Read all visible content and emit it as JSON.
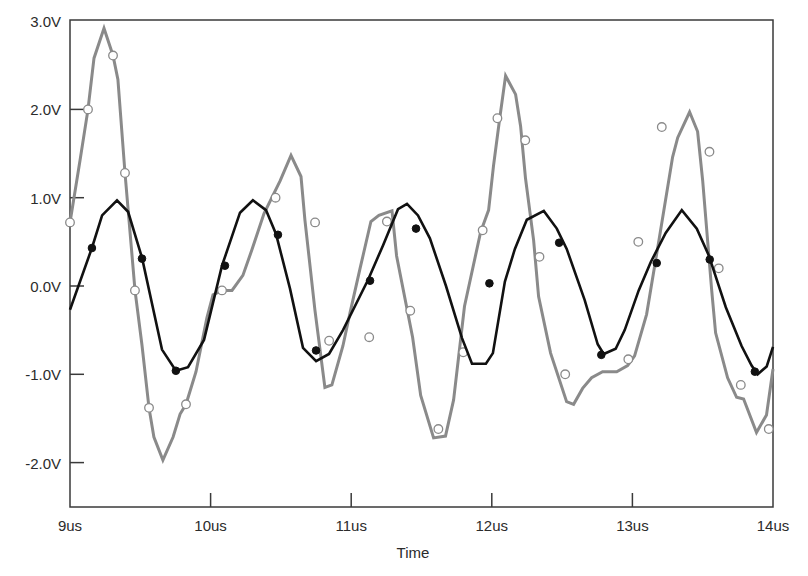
{
  "chart_data": {
    "type": "line",
    "title": "",
    "xlabel": "Time",
    "ylabel": "",
    "xlim": [
      9,
      14
    ],
    "ylim": [
      -2.5,
      3.0
    ],
    "x_ticks": [
      9,
      10,
      11,
      12,
      13,
      14
    ],
    "x_tick_labels": [
      "9us",
      "10us",
      "11us",
      "12us",
      "13us",
      "14us"
    ],
    "y_ticks": [
      3.0,
      2.0,
      1.0,
      0.0,
      -1.0,
      -2.0
    ],
    "y_tick_labels": [
      "3.0V",
      "2.0V",
      "1.0V",
      "0.0V",
      "-1.0V",
      "-2.0V"
    ],
    "grid": false,
    "legend": "none",
    "series": [
      {
        "name": "signal-gray",
        "color": "#8a8a8a",
        "marker": "open-circle",
        "points": [
          [
            9.0,
            0.72
          ],
          [
            9.071,
            1.42
          ],
          [
            9.128,
            2.0
          ],
          [
            9.171,
            2.58
          ],
          [
            9.242,
            2.92
          ],
          [
            9.306,
            2.61
          ],
          [
            9.341,
            2.34
          ],
          [
            9.391,
            1.28
          ],
          [
            9.462,
            -0.05
          ],
          [
            9.512,
            -0.67
          ],
          [
            9.562,
            -1.38
          ],
          [
            9.597,
            -1.71
          ],
          [
            9.661,
            -1.97
          ],
          [
            9.733,
            -1.71
          ],
          [
            9.783,
            -1.45
          ],
          [
            9.825,
            -1.34
          ],
          [
            9.896,
            -0.97
          ],
          [
            9.974,
            -0.36
          ],
          [
            10.017,
            -0.1
          ],
          [
            10.081,
            -0.05
          ],
          [
            10.152,
            -0.05
          ],
          [
            10.23,
            0.12
          ],
          [
            10.294,
            0.41
          ],
          [
            10.38,
            0.82
          ],
          [
            10.494,
            1.19
          ],
          [
            10.572,
            1.48
          ],
          [
            10.643,
            1.24
          ],
          [
            10.671,
            0.75
          ],
          [
            10.742,
            -0.27
          ],
          [
            10.813,
            -1.15
          ],
          [
            10.863,
            -1.12
          ],
          [
            10.941,
            -0.68
          ],
          [
            10.991,
            -0.31
          ],
          [
            11.062,
            0.19
          ],
          [
            11.14,
            0.73
          ],
          [
            11.197,
            0.8
          ],
          [
            11.29,
            0.85
          ],
          [
            11.323,
            0.34
          ],
          [
            11.437,
            -0.58
          ],
          [
            11.494,
            -1.24
          ],
          [
            11.586,
            -1.72
          ],
          [
            11.671,
            -1.7
          ],
          [
            11.728,
            -1.29
          ],
          [
            11.806,
            -0.23
          ],
          [
            11.92,
            0.61
          ],
          [
            11.977,
            0.86
          ],
          [
            12.012,
            1.36
          ],
          [
            12.055,
            1.88
          ],
          [
            12.098,
            2.38
          ],
          [
            12.169,
            2.17
          ],
          [
            12.205,
            1.81
          ],
          [
            12.24,
            1.22
          ],
          [
            12.297,
            0.52
          ],
          [
            12.333,
            -0.12
          ],
          [
            12.418,
            -0.76
          ],
          [
            12.532,
            -1.31
          ],
          [
            12.582,
            -1.34
          ],
          [
            12.646,
            -1.16
          ],
          [
            12.71,
            -1.04
          ],
          [
            12.788,
            -0.97
          ],
          [
            12.888,
            -0.97
          ],
          [
            12.966,
            -0.9
          ],
          [
            13.016,
            -0.79
          ],
          [
            13.101,
            -0.32
          ],
          [
            13.194,
            0.57
          ],
          [
            13.286,
            1.46
          ],
          [
            13.322,
            1.68
          ],
          [
            13.407,
            1.97
          ],
          [
            13.464,
            1.75
          ],
          [
            13.5,
            1.19
          ],
          [
            13.564,
            -0.05
          ],
          [
            13.592,
            -0.53
          ],
          [
            13.677,
            -1.04
          ],
          [
            13.741,
            -1.26
          ],
          [
            13.791,
            -1.28
          ],
          [
            13.883,
            -1.66
          ],
          [
            13.954,
            -1.46
          ],
          [
            14.0,
            -0.94
          ]
        ],
        "markers": [
          [
            9.0,
            0.72
          ],
          [
            9.128,
            2.0
          ],
          [
            9.306,
            2.61
          ],
          [
            9.391,
            1.28
          ],
          [
            9.462,
            -0.05
          ],
          [
            9.562,
            -1.38
          ],
          [
            9.825,
            -1.34
          ],
          [
            10.081,
            -0.05
          ],
          [
            10.462,
            1.0
          ],
          [
            10.743,
            0.72
          ],
          [
            10.843,
            -0.62
          ],
          [
            11.128,
            -0.58
          ],
          [
            11.254,
            0.73
          ],
          [
            11.42,
            -0.28
          ],
          [
            11.62,
            -1.62
          ],
          [
            11.797,
            -0.75
          ],
          [
            11.935,
            0.63
          ],
          [
            12.04,
            1.9
          ],
          [
            12.238,
            1.65
          ],
          [
            12.339,
            0.33
          ],
          [
            12.522,
            -1.0
          ],
          [
            12.971,
            -0.83
          ],
          [
            13.042,
            0.5
          ],
          [
            13.209,
            1.8
          ],
          [
            13.548,
            1.52
          ],
          [
            13.614,
            0.2
          ],
          [
            13.771,
            -1.12
          ],
          [
            13.97,
            -1.62
          ]
        ]
      },
      {
        "name": "signal-black",
        "color": "#111111",
        "marker": "filled-circle",
        "points": [
          [
            9.0,
            -0.27
          ],
          [
            9.156,
            0.43
          ],
          [
            9.228,
            0.8
          ],
          [
            9.334,
            0.97
          ],
          [
            9.413,
            0.84
          ],
          [
            9.512,
            0.32
          ],
          [
            9.654,
            -0.72
          ],
          [
            9.753,
            -0.96
          ],
          [
            9.839,
            -0.92
          ],
          [
            9.953,
            -0.61
          ],
          [
            10.081,
            0.23
          ],
          [
            10.209,
            0.83
          ],
          [
            10.301,
            0.97
          ],
          [
            10.394,
            0.86
          ],
          [
            10.465,
            0.59
          ],
          [
            10.565,
            -0.03
          ],
          [
            10.657,
            -0.7
          ],
          [
            10.75,
            -0.85
          ],
          [
            10.842,
            -0.77
          ],
          [
            10.942,
            -0.5
          ],
          [
            11.12,
            0.07
          ],
          [
            11.226,
            0.46
          ],
          [
            11.333,
            0.87
          ],
          [
            11.397,
            0.93
          ],
          [
            11.475,
            0.8
          ],
          [
            11.56,
            0.54
          ],
          [
            11.674,
            0.0
          ],
          [
            11.788,
            -0.59
          ],
          [
            11.859,
            -0.88
          ],
          [
            11.958,
            -0.88
          ],
          [
            12.008,
            -0.76
          ],
          [
            12.093,
            0.05
          ],
          [
            12.164,
            0.42
          ],
          [
            12.249,
            0.75
          ],
          [
            12.37,
            0.85
          ],
          [
            12.462,
            0.65
          ],
          [
            12.533,
            0.42
          ],
          [
            12.661,
            -0.16
          ],
          [
            12.753,
            -0.66
          ],
          [
            12.796,
            -0.77
          ],
          [
            12.881,
            -0.71
          ],
          [
            12.945,
            -0.5
          ],
          [
            13.045,
            -0.05
          ],
          [
            13.13,
            0.27
          ],
          [
            13.237,
            0.6
          ],
          [
            13.351,
            0.86
          ],
          [
            13.458,
            0.65
          ],
          [
            13.543,
            0.35
          ],
          [
            13.664,
            -0.24
          ],
          [
            13.777,
            -0.68
          ],
          [
            13.848,
            -0.9
          ],
          [
            13.891,
            -1.0
          ],
          [
            13.955,
            -0.91
          ],
          [
            14.0,
            -0.69
          ]
        ],
        "markers": [
          [
            9.156,
            0.43
          ],
          [
            9.512,
            0.31
          ],
          [
            9.753,
            -0.96
          ],
          [
            10.102,
            0.23
          ],
          [
            10.479,
            0.58
          ],
          [
            10.75,
            -0.73
          ],
          [
            11.134,
            0.06
          ],
          [
            11.461,
            0.65
          ],
          [
            11.983,
            0.03
          ],
          [
            12.479,
            0.49
          ],
          [
            12.779,
            -0.78
          ],
          [
            13.173,
            0.26
          ],
          [
            13.55,
            0.3
          ],
          [
            13.871,
            -0.97
          ]
        ]
      }
    ]
  }
}
